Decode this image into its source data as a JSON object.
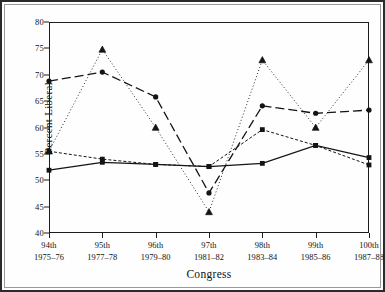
{
  "chart_data": {
    "type": "line",
    "title": "",
    "xlabel": "Congress",
    "ylabel": "Percent Liberal",
    "categories": [
      "94th",
      "95th",
      "96th",
      "97th",
      "98th",
      "99th",
      "100th"
    ],
    "category_sublabels": [
      "1975–76",
      "1977–78",
      "1979–80",
      "1981–82",
      "1983–84",
      "1985–86",
      "1987–88"
    ],
    "ylim": [
      40,
      80
    ],
    "yticks": [
      40,
      45,
      50,
      55,
      60,
      65,
      70,
      75,
      80
    ],
    "ytick_labels": [
      "40",
      "45",
      "50",
      "55",
      "60",
      "65",
      "70",
      "75",
      "80"
    ],
    "grid": false,
    "legend": "none",
    "series": [
      {
        "name": "series-solid-square",
        "line_style": "solid",
        "marker": "filled-square",
        "color": "#141414",
        "values": [
          51.9,
          53.4,
          53.0,
          52.6,
          53.2,
          56.6,
          54.3
        ]
      },
      {
        "name": "series-shortdash-square",
        "line_style": "short-dash",
        "marker": "filled-square",
        "color": "#141414",
        "values": [
          55.5,
          54.0,
          53.0,
          52.6,
          59.6,
          56.6,
          52.9
        ]
      },
      {
        "name": "series-longdash-circle",
        "line_style": "long-dash",
        "marker": "filled-circle",
        "color": "#141414",
        "values": [
          68.8,
          70.5,
          65.8,
          47.6,
          64.1,
          62.7,
          63.3
        ]
      },
      {
        "name": "series-dotted-triangle",
        "line_style": "dotted",
        "marker": "triangle",
        "color": "#141414",
        "values": [
          55.5,
          74.8,
          60.0,
          44.0,
          72.8,
          60.0,
          72.8
        ]
      }
    ]
  },
  "axes": {
    "y_title": "Percent Liberal",
    "x_title": "Congress"
  }
}
